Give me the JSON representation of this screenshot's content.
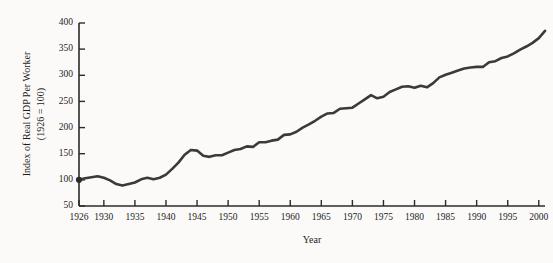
{
  "chart_data": {
    "type": "line",
    "title": "",
    "xlabel": "Year",
    "ylabel": "Index of Real GDP Per Worker (1926 = 100)",
    "ylabel_line1": "Index of Real GDP Per Worker",
    "ylabel_line2": "(1926 = 100)",
    "xlim": [
      1926,
      2001
    ],
    "ylim": [
      50,
      400
    ],
    "grid": false,
    "legend": null,
    "line_color": "#3a3a3a",
    "marker_note": "filled circle at first data point (1926, 100)",
    "yticks": [
      50,
      100,
      150,
      200,
      250,
      300,
      350,
      400
    ],
    "ytick_labels": [
      "50",
      "100",
      "150",
      "200",
      "250",
      "300",
      "350",
      "400"
    ],
    "xticks": [
      1926,
      1930,
      1935,
      1940,
      1945,
      1950,
      1955,
      1960,
      1965,
      1970,
      1975,
      1980,
      1985,
      1990,
      1995,
      2000
    ],
    "xtick_labels": [
      "1926",
      "1930",
      "1935",
      "1940",
      "1945",
      "1950",
      "1955",
      "1960",
      "1965",
      "1970",
      "1975",
      "1980",
      "1985",
      "1990",
      "1995",
      "2000"
    ],
    "x": [
      1926,
      1927,
      1928,
      1929,
      1930,
      1931,
      1932,
      1933,
      1934,
      1935,
      1936,
      1937,
      1938,
      1939,
      1940,
      1941,
      1942,
      1943,
      1944,
      1945,
      1946,
      1947,
      1948,
      1949,
      1950,
      1951,
      1952,
      1953,
      1954,
      1955,
      1956,
      1957,
      1958,
      1959,
      1960,
      1961,
      1962,
      1963,
      1964,
      1965,
      1966,
      1967,
      1968,
      1969,
      1970,
      1971,
      1972,
      1973,
      1974,
      1975,
      1976,
      1977,
      1978,
      1979,
      1980,
      1981,
      1982,
      1983,
      1984,
      1985,
      1986,
      1987,
      1988,
      1989,
      1990,
      1991,
      1992,
      1993,
      1994,
      1995,
      1996,
      1997,
      1998,
      1999,
      2000,
      2001
    ],
    "values": [
      100,
      103,
      105,
      107,
      104,
      99,
      92,
      89,
      92,
      95,
      101,
      104,
      101,
      104,
      110,
      121,
      133,
      148,
      157,
      156,
      146,
      144,
      147,
      147,
      152,
      157,
      159,
      164,
      163,
      172,
      172,
      175,
      177,
      186,
      187,
      192,
      200,
      206,
      213,
      221,
      227,
      228,
      236,
      237,
      238,
      246,
      254,
      262,
      256,
      259,
      268,
      273,
      278,
      279,
      276,
      280,
      277,
      285,
      296,
      301,
      305,
      309,
      313,
      315,
      316,
      316,
      325,
      327,
      333,
      336,
      342,
      349,
      355,
      362,
      371,
      385
    ],
    "annotations": []
  },
  "axis_labels": {
    "y_title_line1": "Index of Real GDP Per Worker",
    "y_title_line2": "(1926 = 100)",
    "x_title": "Year"
  }
}
